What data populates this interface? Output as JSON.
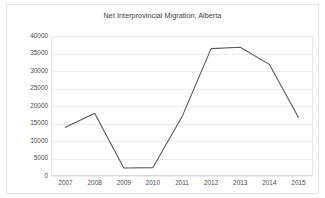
{
  "chart_data": {
    "type": "line",
    "title": "Net Interprovincial Migration, Alberta",
    "xlabel": "",
    "ylabel": "",
    "categories": [
      "2007",
      "2008",
      "2009",
      "2010",
      "2011",
      "2012",
      "2013",
      "2014",
      "2015"
    ],
    "series": [
      {
        "name": "Net Interprovincial Migration",
        "values": [
          13900,
          17900,
          2300,
          2400,
          16900,
          36400,
          36800,
          31900,
          16700
        ],
        "color": "#595959"
      }
    ],
    "ylim": [
      0,
      40000
    ],
    "yticks": [
      0,
      5000,
      10000,
      15000,
      20000,
      25000,
      30000,
      35000,
      40000
    ],
    "ytick_labels": [
      "0",
      "5000",
      "10000",
      "15000",
      "20000",
      "25000",
      "30000",
      "35000",
      "40000"
    ],
    "grid": true,
    "legend": false,
    "legend_position": "none",
    "plot_background": "#ffffff",
    "gridline_color": "#ededed",
    "axis_text_color": "#4a4a4a",
    "title_color": "#3a3a3a",
    "frame_color": "#e3e3e3"
  }
}
